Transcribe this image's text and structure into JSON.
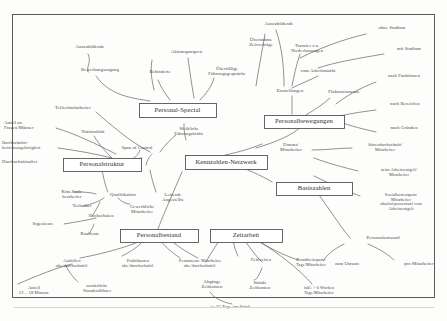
{
  "diagram": {
    "type": "mind-map",
    "title": "Kennzahlen-Netzwerk",
    "language": "de",
    "frame": {
      "stroke": "#4a4a4a"
    },
    "main_nodes": [
      {
        "id": "center",
        "label": "Kennzahlen-Netzwerk",
        "x": 185,
        "y": 155,
        "w": 82,
        "h": 14
      },
      {
        "id": "personal_special",
        "label": "Personal-Special",
        "x": 139,
        "y": 103,
        "w": 77,
        "h": 14
      },
      {
        "id": "personalbewegungen",
        "label": "Personalbewegungen",
        "x": 264,
        "y": 115,
        "w": 80,
        "h": 13
      },
      {
        "id": "basiszahlen",
        "label": "Basiszahlen",
        "x": 276,
        "y": 182,
        "w": 76,
        "h": 13
      },
      {
        "id": "personalstruktur",
        "label": "Personalstruktur",
        "x": 63,
        "y": 158,
        "w": 78,
        "h": 13
      },
      {
        "id": "personalbestand",
        "label": "Personalbestand",
        "x": 120,
        "y": 229,
        "w": 78,
        "h": 13
      },
      {
        "id": "zeitarbeit",
        "label": "Zeitarbeit",
        "x": 210,
        "y": 229,
        "w": 72,
        "h": 13
      }
    ],
    "leaf_nodes": [
      {
        "id": "ausbildende",
        "label": "Auszubildende",
        "x": 64,
        "y": 45,
        "w": 52,
        "align": "center",
        "size": "leaf"
      },
      {
        "id": "bewerbungszugang",
        "label": "Bewerbungszugang",
        "x": 70,
        "y": 68,
        "w": 60,
        "align": "center",
        "size": "leaf"
      },
      {
        "id": "aktionsparquete",
        "label": "Aktionsparquete",
        "x": 160,
        "y": 50,
        "w": 54,
        "align": "center",
        "size": "leaf"
      },
      {
        "id": "behinderte",
        "label": "Behinderte",
        "x": 139,
        "y": 70,
        "w": 42,
        "align": "center",
        "size": "leaf"
      },
      {
        "id": "ueberfaellige",
        "label": "Überfällige\nFührungsgespräche",
        "x": 196,
        "y": 67,
        "w": 62,
        "align": "center",
        "size": "leaf"
      },
      {
        "id": "auszubildende2",
        "label": "Auszubildende",
        "x": 253,
        "y": 22,
        "w": 52,
        "align": "center",
        "size": "leaf"
      },
      {
        "id": "uebernahme",
        "label": "Übernahme\nZeitverträge",
        "x": 236,
        "y": 38,
        "w": 50,
        "align": "center",
        "size": "leaf"
      },
      {
        "id": "transfer",
        "label": "Transfer v.a.\nNiederlassungen",
        "x": 280,
        "y": 44,
        "w": 54,
        "align": "center",
        "size": "leaf"
      },
      {
        "id": "vom_arbeitsmarkt",
        "label": "vom Arbeitsmarkt",
        "x": 290,
        "y": 69,
        "w": 56,
        "align": "center",
        "size": "leaf"
      },
      {
        "id": "ohne_studium",
        "label": "ohne Studium",
        "x": 368,
        "y": 26,
        "w": 48,
        "align": "center",
        "size": "leaf"
      },
      {
        "id": "mit_studium",
        "label": "mit Studium",
        "x": 386,
        "y": 47,
        "w": 46,
        "align": "center",
        "size": "leaf"
      },
      {
        "id": "einstellungen",
        "label": "Einstellungen",
        "x": 266,
        "y": 89,
        "w": 48,
        "align": "center",
        "size": "leaf"
      },
      {
        "id": "fluktuationsrate",
        "label": "Fluktuationsrate",
        "x": 318,
        "y": 90,
        "w": 52,
        "align": "center",
        "size": "leaf"
      },
      {
        "id": "nach_funktionen",
        "label": "nach Funktionen",
        "x": 376,
        "y": 74,
        "w": 56,
        "align": "center",
        "size": "leaf"
      },
      {
        "id": "nach_bereichen",
        "label": "nach Bereichen",
        "x": 378,
        "y": 102,
        "w": 54,
        "align": "center",
        "size": "leaf"
      },
      {
        "id": "nach_gruenden",
        "label": "nach Gründen",
        "x": 378,
        "y": 126,
        "w": 52,
        "align": "center",
        "size": "leaf"
      },
      {
        "id": "teilzeit",
        "label": "Teilzeitmitarbeiter",
        "x": 44,
        "y": 106,
        "w": 58,
        "align": "center",
        "size": "leaf"
      },
      {
        "id": "anteil_frauen",
        "label": "Anteil an\nFrauen/Männer",
        "x": 4,
        "y": 121,
        "w": 48,
        "align": "left",
        "size": "leaf"
      },
      {
        "id": "nationalitaet",
        "label": "Nationalität",
        "x": 72,
        "y": 130,
        "w": 42,
        "align": "center",
        "size": "leaf"
      },
      {
        "id": "durchschnitt_bz",
        "label": "Durchschnitts-\nbetriebszugehörigkeit",
        "x": 2,
        "y": 141,
        "w": 66,
        "align": "left",
        "size": "leafsm"
      },
      {
        "id": "span_of_control",
        "label": "Span of Control",
        "x": 112,
        "y": 146,
        "w": 50,
        "align": "center",
        "size": "leaf"
      },
      {
        "id": "durchschnittsalter",
        "label": "Durchschnittsalter",
        "x": 2,
        "y": 160,
        "w": 56,
        "align": "left",
        "size": "leaf"
      },
      {
        "id": "weibliche",
        "label": "Weibliche\nFührungskräfte",
        "x": 163,
        "y": 127,
        "w": 52,
        "align": "center",
        "size": "leaf"
      },
      {
        "id": "kfm_sach",
        "label": "Kfm.Sach-\nbearbeiter",
        "x": 50,
        "y": 190,
        "w": 44,
        "align": "center",
        "size": "leaf"
      },
      {
        "id": "qualifikation",
        "label": "Qualifikation",
        "x": 100,
        "y": 193,
        "w": 46,
        "align": "center",
        "size": "leaf"
      },
      {
        "id": "techniker",
        "label": "Techniker",
        "x": 62,
        "y": 204,
        "w": 40,
        "align": "center",
        "size": "leaf"
      },
      {
        "id": "gewerbliche",
        "label": "Gewerbliche\nMitarbeiter",
        "x": 118,
        "y": 205,
        "w": 48,
        "align": "center",
        "size": "leaf"
      },
      {
        "id": "hochschulen",
        "label": "Hochschulen",
        "x": 78,
        "y": 214,
        "w": 46,
        "align": "center",
        "size": "leaf"
      },
      {
        "id": "ingenieure",
        "label": "Ingenieure",
        "x": 22,
        "y": 222,
        "w": 42,
        "align": "center",
        "size": "leaf"
      },
      {
        "id": "kaufleute",
        "label": "Kaufleute",
        "x": 70,
        "y": 232,
        "w": 40,
        "align": "center",
        "size": "leaf"
      },
      {
        "id": "leitende",
        "label": "Leitende\nAngestellte",
        "x": 150,
        "y": 193,
        "w": 46,
        "align": "center",
        "size": "leaf"
      },
      {
        "id": "umsatz_ma",
        "label": "Umsatz/\nMitarbeiter",
        "x": 268,
        "y": 143,
        "w": 46,
        "align": "center",
        "size": "leaf"
      },
      {
        "id": "jahresdurch",
        "label": "Jahresdurchschnitt/\nMitarbeiter",
        "x": 354,
        "y": 143,
        "w": 62,
        "align": "center",
        "size": "leafsm"
      },
      {
        "id": "netto_ae",
        "label": "netto Arbeitsentgelt/\nMitarbeiter",
        "x": 368,
        "y": 168,
        "w": 62,
        "align": "center",
        "size": "leafsm"
      },
      {
        "id": "sozialkosten",
        "label": "Sozialkostenquote\nMitarbeiter\nabsolut/prozentual vom\nArbeitsentgelt",
        "x": 366,
        "y": 193,
        "w": 70,
        "align": "center",
        "size": "leafsm"
      },
      {
        "id": "personalaufwand",
        "label": "Personalaufwand",
        "x": 355,
        "y": 236,
        "w": 56,
        "align": "center",
        "size": "leaf"
      },
      {
        "id": "zum_umsatz",
        "label": "zum Umsatz",
        "x": 324,
        "y": 262,
        "w": 46,
        "align": "center",
        "size": "leaf"
      },
      {
        "id": "pro_mitarbeiter",
        "label": "pro Mitarbeiter",
        "x": 394,
        "y": 262,
        "w": 50,
        "align": "center",
        "size": "leaf"
      },
      {
        "id": "aushilfen",
        "label": "Aushilfen\nabs./durchschnittl.",
        "x": 42,
        "y": 259,
        "w": 60,
        "align": "center",
        "size": "leafsm"
      },
      {
        "id": "praktikanten",
        "label": "Praktikanten\nabs./durchschnittl.",
        "x": 108,
        "y": 259,
        "w": 60,
        "align": "center",
        "size": "leafsm"
      },
      {
        "id": "permanente",
        "label": "Permanente Mitarbeiter\nabs./durchschnittl.",
        "x": 162,
        "y": 259,
        "w": 76,
        "align": "center",
        "size": "leafsm"
      },
      {
        "id": "anteil_12_18",
        "label": "Anteil\n12 – 18 Monate",
        "x": 8,
        "y": 286,
        "w": 52,
        "align": "center",
        "size": "leaf"
      },
      {
        "id": "zusaetzliche",
        "label": "zusätzliche\nStundenlöhner",
        "x": 72,
        "y": 284,
        "w": 50,
        "align": "center",
        "size": "leaf"
      },
      {
        "id": "fehlzeiten",
        "label": "Fehlzeiten",
        "x": 240,
        "y": 258,
        "w": 42,
        "align": "center",
        "size": "leaf"
      },
      {
        "id": "staende",
        "label": "Stände\nZeitkonten",
        "x": 238,
        "y": 281,
        "w": 44,
        "align": "center",
        "size": "leaf"
      },
      {
        "id": "abgaenge",
        "label": "Abgänge\nZeitkonten",
        "x": 190,
        "y": 280,
        "w": 44,
        "align": "center",
        "size": "leaf"
      },
      {
        "id": "krankheitsquote",
        "label": "Krankheitsquote\nTage/Mitarbeiter",
        "x": 282,
        "y": 258,
        "w": 58,
        "align": "center",
        "size": "leafsm"
      },
      {
        "id": "inkl_6_wochen",
        "label": "inkl. > 6 Wochen\nTage/Mitarbeiter",
        "x": 290,
        "y": 286,
        "w": 58,
        "align": "center",
        "size": "leafsm"
      },
      {
        "id": "tage_am_stueck",
        "label": ">= 25 Tage am Stück",
        "x": 194,
        "y": 305,
        "w": 72,
        "align": "center",
        "size": "leaf"
      }
    ],
    "wires": [
      "M 88 54 C 92 62 86 66 88 72",
      "M 96 76 C 110 96 132 98 150 101",
      "M 152 60 C 150 72 152 80 154 90",
      "M 158 80 C 162 90 166 94 170 100",
      "M 188 58 C 190 74 192 86 194 98",
      "M 214 78 C 212 86 206 94 200 100",
      "M 265 34 C 262 52 258 72 256 86",
      "M 276 30 C 282 48 284 66 284 86",
      "M 300 54 C 296 66 294 76 292 86",
      "M 318 76 C 310 80 300 84 292 88",
      "M 366 34 C 340 40 316 50 300 58",
      "M 384 54 C 360 58 336 62 318 68",
      "M 292 96 C 292 104 292 110 292 114",
      "M 330 98 C 324 104 314 110 306 115",
      "M 376 82 C 360 88 346 96 336 104",
      "M 376 110 C 360 112 348 114 340 116",
      "M 376 132 C 358 128 344 124 336 120",
      "M 300 128 C 290 136 276 142 256 148",
      "M 225 155 C 240 152 252 148 262 144",
      "M 225 162 C 246 168 262 176 272 182",
      "M 312 150 C 326 150 340 148 352 148",
      "M 314 158 C 330 164 346 168 358 171",
      "M 314 176 C 334 186 350 192 360 196",
      "M 314 188 C 330 210 340 226 350 238",
      "M 344 244 C 332 250 326 256 324 260",
      "M 368 244 C 382 250 390 256 394 260",
      "M 96 112 C 110 124 130 142 150 152",
      "M 56 128 C 76 134 96 144 116 154",
      "M 58 148 C 74 150 96 154 112 158",
      "M 94 136 C 100 146 106 152 112 158",
      "M 140 150 C 138 156 134 158 130 160",
      "M 103 164 C 112 162 124 160 142 158",
      "M 146 165 C 148 158 150 156 152 154",
      "M 186 140 C 184 132 184 128 184 124",
      "M 176 135 C 170 140 164 146 160 152",
      "M 102 170 C 104 180 106 188 108 192",
      "M 96 194 C 90 192 82 192 74 192",
      "M 104 198 C 98 202 92 204 84 206",
      "M 118 198 C 122 202 126 204 130 204",
      "M 100 202 C 96 210 94 214 92 216",
      "M 64 224 C 76 222 88 220 96 218",
      "M 94 224 C 92 230 90 232 88 234",
      "M 150 170 C 152 180 154 186 156 192",
      "M 158 229 C 162 218 170 200 182 172",
      "M 152 236 C 136 244 112 252 80 258",
      "M 146 238 C 140 246 130 252 122 256",
      "M 160 240 C 166 248 174 254 180 258",
      "M 170 240 C 180 248 190 254 198 258",
      "M 72 264 C 56 268 36 276 18 284",
      "M 66 266 C 70 274 74 278 78 282",
      "M 222 236 C 216 246 210 254 206 262",
      "M 232 236 C 234 246 236 252 238 256",
      "M 242 236 C 248 246 256 256 262 262",
      "M 250 236 C 268 248 286 256 298 260",
      "M 254 238 C 280 254 300 270 312 284",
      "M 210 292 C 214 298 222 302 232 304",
      "M 262 268 C 258 278 256 280 254 280"
    ]
  }
}
